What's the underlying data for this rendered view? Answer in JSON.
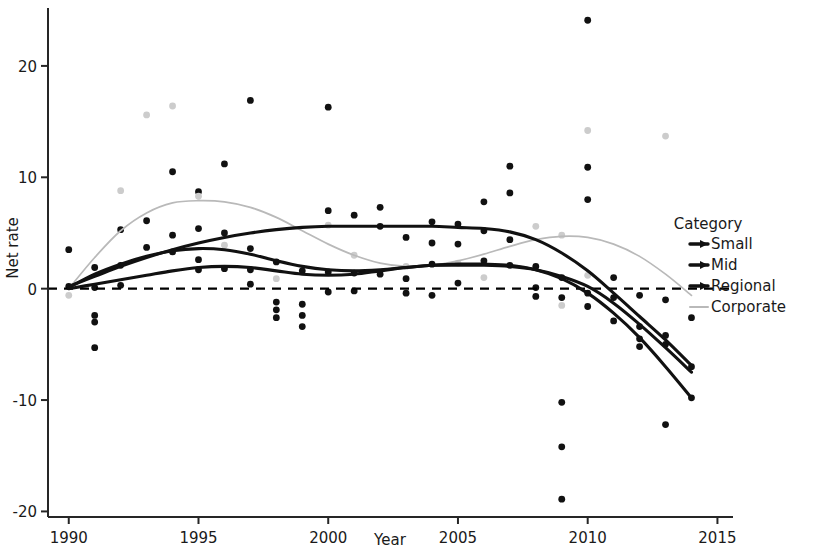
{
  "chart_data": {
    "type": "scatter",
    "title": "",
    "xlabel": "Year",
    "ylabel": "Net rate",
    "xlim": [
      1989.2,
      2015.6
    ],
    "ylim": [
      -20.5,
      25.2
    ],
    "xticks": [
      1990,
      1995,
      2000,
      2005,
      2010,
      2015
    ],
    "xtick_labels": [
      "1990",
      "1995",
      "2000",
      "2005",
      "2010",
      "2015"
    ],
    "yticks": [
      20,
      10,
      0,
      -10,
      -20
    ],
    "ytick_labels": [
      "20",
      "10",
      "0",
      "-10",
      "-20"
    ],
    "grid": false,
    "reference_line": {
      "y": 0,
      "style": "dashed",
      "color": "#000000"
    },
    "legend": {
      "title": "Category",
      "position": "right",
      "entries": [
        {
          "name": "Small",
          "color": "#111111",
          "marker": "line"
        },
        {
          "name": "Mid",
          "color": "#111111",
          "marker": "line"
        },
        {
          "name": "Regional",
          "color": "#111111",
          "marker": "line"
        },
        {
          "name": "Corporate",
          "color": "#b9b9b9",
          "marker": "line"
        }
      ]
    },
    "series": [
      {
        "name": "Small",
        "color": "#111111",
        "type": "smooth-line",
        "x": [
          1990,
          1991,
          1992,
          1993,
          1994,
          1995,
          1996,
          1997,
          1998,
          1999,
          2000,
          2001,
          2002,
          2003,
          2004,
          2005,
          2006,
          2007,
          2008,
          2009,
          2010,
          2011,
          2012,
          2013,
          2014
        ],
        "values": [
          0.2,
          1.1,
          2.0,
          2.8,
          3.5,
          4.1,
          4.6,
          5.0,
          5.3,
          5.5,
          5.6,
          5.6,
          5.6,
          5.6,
          5.6,
          5.5,
          5.4,
          5.1,
          4.4,
          3.2,
          1.6,
          -0.4,
          -2.5,
          -4.6,
          -6.9
        ]
      },
      {
        "name": "Mid",
        "color": "#111111",
        "type": "smooth-line",
        "x": [
          1990,
          1991,
          1992,
          1993,
          1994,
          1995,
          1996,
          1997,
          1998,
          1999,
          2000,
          2001,
          2002,
          2003,
          2004,
          2005,
          2006,
          2007,
          2008,
          2009,
          2010,
          2011,
          2012,
          2013,
          2014
        ],
        "values": [
          0.1,
          1.3,
          2.2,
          2.9,
          3.4,
          3.6,
          3.5,
          3.1,
          2.5,
          2.0,
          1.7,
          1.6,
          1.7,
          1.9,
          2.1,
          2.1,
          2.1,
          2.0,
          1.7,
          1.1,
          0.2,
          -1.3,
          -3.2,
          -5.3,
          -7.5
        ]
      },
      {
        "name": "Regional",
        "color": "#111111",
        "type": "smooth-line",
        "x": [
          1990,
          1991,
          1992,
          1993,
          1994,
          1995,
          1996,
          1997,
          1998,
          1999,
          2000,
          2001,
          2002,
          2003,
          2004,
          2005,
          2006,
          2007,
          2008,
          2009,
          2010,
          2011,
          2012,
          2013,
          2014
        ],
        "values": [
          0.0,
          0.4,
          0.8,
          1.2,
          1.6,
          1.9,
          2.0,
          1.9,
          1.6,
          1.3,
          1.2,
          1.3,
          1.6,
          1.9,
          2.1,
          2.2,
          2.2,
          2.1,
          1.7,
          0.9,
          -0.4,
          -2.2,
          -4.4,
          -7.0,
          -9.8
        ]
      },
      {
        "name": "Corporate",
        "color": "#b9b9b9",
        "type": "smooth-line",
        "x": [
          1990,
          1991,
          1992,
          1993,
          1994,
          1995,
          1996,
          1997,
          1998,
          1999,
          2000,
          2001,
          2002,
          2003,
          2004,
          2005,
          2006,
          2007,
          2008,
          2009,
          2010,
          2011,
          2012,
          2013,
          2014
        ],
        "values": [
          0.0,
          2.8,
          5.2,
          6.8,
          7.7,
          7.9,
          7.8,
          7.3,
          6.4,
          5.2,
          4.0,
          3.0,
          2.3,
          2.0,
          2.1,
          2.5,
          3.1,
          3.8,
          4.4,
          4.7,
          4.6,
          4.0,
          2.9,
          1.3,
          -0.6
        ]
      }
    ],
    "scatter_points": [
      {
        "x": 1990,
        "y": 3.5,
        "color": "#111111"
      },
      {
        "x": 1990,
        "y": 0.2,
        "color": "#111111"
      },
      {
        "x": 1990,
        "y": -0.6,
        "color": "#cccccc"
      },
      {
        "x": 1991,
        "y": 1.9,
        "color": "#111111"
      },
      {
        "x": 1991,
        "y": 0.1,
        "color": "#111111"
      },
      {
        "x": 1991,
        "y": -2.4,
        "color": "#111111"
      },
      {
        "x": 1991,
        "y": -3.0,
        "color": "#111111"
      },
      {
        "x": 1991,
        "y": -5.3,
        "color": "#111111"
      },
      {
        "x": 1992,
        "y": 8.8,
        "color": "#cccccc"
      },
      {
        "x": 1992,
        "y": 5.3,
        "color": "#111111"
      },
      {
        "x": 1992,
        "y": 2.1,
        "color": "#111111"
      },
      {
        "x": 1992,
        "y": 0.3,
        "color": "#111111"
      },
      {
        "x": 1993,
        "y": 15.6,
        "color": "#cccccc"
      },
      {
        "x": 1993,
        "y": 6.1,
        "color": "#111111"
      },
      {
        "x": 1993,
        "y": 3.7,
        "color": "#111111"
      },
      {
        "x": 1994,
        "y": 16.4,
        "color": "#cccccc"
      },
      {
        "x": 1994,
        "y": 10.5,
        "color": "#111111"
      },
      {
        "x": 1994,
        "y": 4.8,
        "color": "#111111"
      },
      {
        "x": 1994,
        "y": 3.3,
        "color": "#111111"
      },
      {
        "x": 1995,
        "y": 8.7,
        "color": "#111111"
      },
      {
        "x": 1995,
        "y": 8.3,
        "color": "#cccccc"
      },
      {
        "x": 1995,
        "y": 5.4,
        "color": "#111111"
      },
      {
        "x": 1995,
        "y": 2.6,
        "color": "#111111"
      },
      {
        "x": 1995,
        "y": 1.7,
        "color": "#111111"
      },
      {
        "x": 1996,
        "y": 11.2,
        "color": "#111111"
      },
      {
        "x": 1996,
        "y": 5.0,
        "color": "#111111"
      },
      {
        "x": 1996,
        "y": 3.9,
        "color": "#cccccc"
      },
      {
        "x": 1996,
        "y": 1.8,
        "color": "#111111"
      },
      {
        "x": 1997,
        "y": 16.9,
        "color": "#111111"
      },
      {
        "x": 1997,
        "y": 3.6,
        "color": "#111111"
      },
      {
        "x": 1997,
        "y": 1.7,
        "color": "#111111"
      },
      {
        "x": 1997,
        "y": 0.4,
        "color": "#111111"
      },
      {
        "x": 1998,
        "y": 2.4,
        "color": "#111111"
      },
      {
        "x": 1998,
        "y": 0.9,
        "color": "#cccccc"
      },
      {
        "x": 1998,
        "y": -1.2,
        "color": "#111111"
      },
      {
        "x": 1998,
        "y": -1.9,
        "color": "#111111"
      },
      {
        "x": 1998,
        "y": -2.6,
        "color": "#111111"
      },
      {
        "x": 1999,
        "y": 1.6,
        "color": "#111111"
      },
      {
        "x": 1999,
        "y": -1.4,
        "color": "#111111"
      },
      {
        "x": 1999,
        "y": -2.4,
        "color": "#111111"
      },
      {
        "x": 1999,
        "y": -3.4,
        "color": "#111111"
      },
      {
        "x": 2000,
        "y": 16.3,
        "color": "#111111"
      },
      {
        "x": 2000,
        "y": 7.0,
        "color": "#111111"
      },
      {
        "x": 2000,
        "y": 5.7,
        "color": "#cccccc"
      },
      {
        "x": 2000,
        "y": 1.5,
        "color": "#111111"
      },
      {
        "x": 2000,
        "y": -0.3,
        "color": "#111111"
      },
      {
        "x": 2001,
        "y": 6.6,
        "color": "#111111"
      },
      {
        "x": 2001,
        "y": 3.0,
        "color": "#cccccc"
      },
      {
        "x": 2001,
        "y": 1.4,
        "color": "#111111"
      },
      {
        "x": 2001,
        "y": -0.2,
        "color": "#111111"
      },
      {
        "x": 2002,
        "y": 7.3,
        "color": "#111111"
      },
      {
        "x": 2002,
        "y": 5.6,
        "color": "#111111"
      },
      {
        "x": 2002,
        "y": 1.3,
        "color": "#111111"
      },
      {
        "x": 2003,
        "y": 4.6,
        "color": "#111111"
      },
      {
        "x": 2003,
        "y": 2.0,
        "color": "#cccccc"
      },
      {
        "x": 2003,
        "y": 0.9,
        "color": "#111111"
      },
      {
        "x": 2003,
        "y": -0.4,
        "color": "#111111"
      },
      {
        "x": 2004,
        "y": 6.0,
        "color": "#111111"
      },
      {
        "x": 2004,
        "y": 4.1,
        "color": "#111111"
      },
      {
        "x": 2004,
        "y": 2.2,
        "color": "#111111"
      },
      {
        "x": 2004,
        "y": -0.6,
        "color": "#111111"
      },
      {
        "x": 2005,
        "y": 5.8,
        "color": "#111111"
      },
      {
        "x": 2005,
        "y": 4.0,
        "color": "#111111"
      },
      {
        "x": 2005,
        "y": 2.3,
        "color": "#cccccc"
      },
      {
        "x": 2005,
        "y": 0.5,
        "color": "#111111"
      },
      {
        "x": 2006,
        "y": 7.8,
        "color": "#111111"
      },
      {
        "x": 2006,
        "y": 5.2,
        "color": "#111111"
      },
      {
        "x": 2006,
        "y": 2.5,
        "color": "#111111"
      },
      {
        "x": 2006,
        "y": 1.0,
        "color": "#cccccc"
      },
      {
        "x": 2007,
        "y": 11.0,
        "color": "#111111"
      },
      {
        "x": 2007,
        "y": 8.6,
        "color": "#111111"
      },
      {
        "x": 2007,
        "y": 4.4,
        "color": "#111111"
      },
      {
        "x": 2007,
        "y": 2.1,
        "color": "#111111"
      },
      {
        "x": 2008,
        "y": 5.6,
        "color": "#cccccc"
      },
      {
        "x": 2008,
        "y": 2.0,
        "color": "#111111"
      },
      {
        "x": 2008,
        "y": 0.1,
        "color": "#111111"
      },
      {
        "x": 2008,
        "y": -0.7,
        "color": "#111111"
      },
      {
        "x": 2009,
        "y": 4.8,
        "color": "#cccccc"
      },
      {
        "x": 2009,
        "y": 1.0,
        "color": "#111111"
      },
      {
        "x": 2009,
        "y": -0.8,
        "color": "#111111"
      },
      {
        "x": 2009,
        "y": -1.5,
        "color": "#cccccc"
      },
      {
        "x": 2009,
        "y": -10.2,
        "color": "#111111"
      },
      {
        "x": 2009,
        "y": -14.2,
        "color": "#111111"
      },
      {
        "x": 2009,
        "y": -18.9,
        "color": "#111111"
      },
      {
        "x": 2010,
        "y": 24.1,
        "color": "#111111"
      },
      {
        "x": 2010,
        "y": 14.2,
        "color": "#cccccc"
      },
      {
        "x": 2010,
        "y": 10.9,
        "color": "#111111"
      },
      {
        "x": 2010,
        "y": 8.0,
        "color": "#111111"
      },
      {
        "x": 2010,
        "y": 1.2,
        "color": "#cccccc"
      },
      {
        "x": 2010,
        "y": -0.4,
        "color": "#111111"
      },
      {
        "x": 2010,
        "y": -1.6,
        "color": "#111111"
      },
      {
        "x": 2011,
        "y": 1.0,
        "color": "#111111"
      },
      {
        "x": 2011,
        "y": -0.8,
        "color": "#111111"
      },
      {
        "x": 2011,
        "y": -2.9,
        "color": "#111111"
      },
      {
        "x": 2012,
        "y": -0.6,
        "color": "#111111"
      },
      {
        "x": 2012,
        "y": -3.4,
        "color": "#111111"
      },
      {
        "x": 2012,
        "y": -4.5,
        "color": "#111111"
      },
      {
        "x": 2012,
        "y": -5.2,
        "color": "#111111"
      },
      {
        "x": 2013,
        "y": 13.7,
        "color": "#cccccc"
      },
      {
        "x": 2013,
        "y": -1.0,
        "color": "#111111"
      },
      {
        "x": 2013,
        "y": -4.2,
        "color": "#111111"
      },
      {
        "x": 2013,
        "y": -5.0,
        "color": "#111111"
      },
      {
        "x": 2013,
        "y": -12.2,
        "color": "#111111"
      },
      {
        "x": 2014,
        "y": -2.6,
        "color": "#111111"
      },
      {
        "x": 2014,
        "y": -7.0,
        "color": "#111111"
      },
      {
        "x": 2014,
        "y": -9.8,
        "color": "#111111"
      }
    ]
  }
}
